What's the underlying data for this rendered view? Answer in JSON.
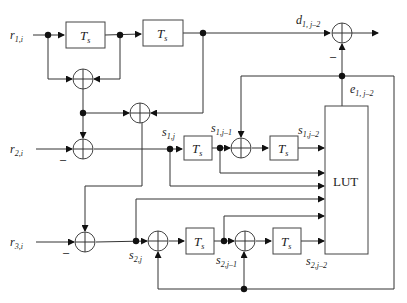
{
  "diagram": {
    "inputs": {
      "r1": {
        "base": "r",
        "sub": "1,i"
      },
      "r2": {
        "base": "r",
        "sub": "2,i"
      },
      "r3": {
        "base": "r",
        "sub": "3,i"
      }
    },
    "delay_label": {
      "base": "T",
      "sub": "s"
    },
    "lut_label": "LUT",
    "minus_sign": "–",
    "signals": {
      "d1": {
        "base": "d",
        "sub": "1, j–2"
      },
      "e1": {
        "base": "e",
        "sub": "1, j–2"
      },
      "s1j": {
        "base": "s",
        "sub": "1,j"
      },
      "s1j1": {
        "base": "s",
        "sub": "1,j–1"
      },
      "s1j2": {
        "base": "s",
        "sub": "1,j–2"
      },
      "s2j": {
        "base": "s",
        "sub": "2,j"
      },
      "s2j1": {
        "base": "s",
        "sub": "2,j–1"
      },
      "s2j2": {
        "base": "s",
        "sub": "2,j–2"
      }
    }
  }
}
